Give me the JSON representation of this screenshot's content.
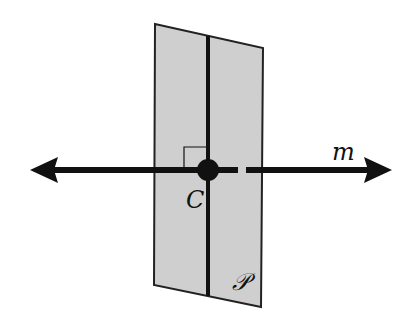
{
  "diagram": {
    "colors": {
      "background": "#ffffff",
      "plane_fill": "#cfcfcf",
      "plane_stroke": "#222222",
      "line": "#111111"
    },
    "plane": {
      "label": "𝒫",
      "corners": [
        [
          155,
          24
        ],
        [
          263,
          48
        ],
        [
          261,
          307
        ],
        [
          154,
          285
        ]
      ]
    },
    "line_in_plane": {
      "x1": 208,
      "y1": 36,
      "x2": 208,
      "y2": 296
    },
    "line_m": {
      "label": "m",
      "y": 170,
      "x_start": 30,
      "x_end": 392,
      "gap_start": 238,
      "gap_end": 246,
      "arrows": "both"
    },
    "point": {
      "label": "C",
      "x": 208,
      "y": 170
    },
    "right_angle_marker": true
  }
}
